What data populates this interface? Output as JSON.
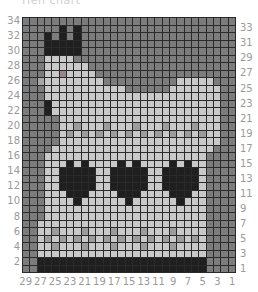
{
  "title": "Hen chart",
  "chart": {
    "columns": 29,
    "rows": 34,
    "legend": {
      ".": {
        "name": "background",
        "color": "#7c7c7c"
      },
      "L": {
        "name": "light",
        "color": "#c9c9c9"
      },
      "M": {
        "name": "medium",
        "color": "#9c9c9c"
      },
      "D": {
        "name": "dark",
        "color": "#1f1f1f"
      },
      "E": {
        "name": "eye",
        "color": "#9a8686"
      },
      "B": {
        "name": "beak",
        "color": "#a8a8a8"
      }
    },
    "grid_rows_top_to_bottom": [
      ".............................",
      ".....D.D.....................",
      "...D.D.D.....................",
      "...DDDDD.....................",
      "...DDDDD.....................",
      "...LLLL......................",
      "...LLLLLL....................",
      "...LLELLLL...................",
      "..BLLLLLLLL..........LLLLL...",
      "...LLLLLLLLLLL......LLLLLLL..",
      "...LLLLLLLLLLLLLLLLLLLLLLLL..",
      "...DLLLLLLLLLLLLLLLLLLLLLLL..",
      "...DLLLLLLLLLLLLLLLLLLLLLLL..",
      ".....LLLLLLLLLLLLLLLLLLLLLL..",
      ".....LLMLLLMLLLMLLLMLLLMLLL..",
      ".....LMLMLMLMLMLMLMLMLMLMLL..",
      ".....LLLLLLLLLLLLLLLLLLLLLL..",
      "....LLLLLLLLLLLLLLLLLLLLLL...",
      "...LLLLLLLLLLLLLLLLLLLLLL....",
      "...LLLDLDLLLLDLDLLLLDLDLL....",
      "...LLDDDDDLLDDDDDLLDDDDDL....",
      "...LLDDDDDLLDDDDDLLDDDDDL....",
      "...LLDDDDDLLDDDDDLLDDDDDL....",
      "...LLLDDDLLLLDDDLLLLDDDLL....",
      "...LLLLDLLLLLLDLLLLLLDLLL....",
      "...LLLLLLLLLLLLLLLLLLLLLL....",
      "...LLLLLLLLLLLLLLLLLLLLLL....",
      "..LLLLLLLLLLLLLLLLLLLLLLL....",
      "..LLMLLLMLLLMLLLMLLLMLLLL....",
      "..LMLMLMLMLMLMLMLMLMLMLML....",
      "..LLMLLLMLLLMLLLMLLLMLLLL....",
      "..LLLLLLLLLLLLLLLLLLLLLLL....",
      "..DDDDDDDDDDDDDDDDDDDDDDD....",
      "..DDDDDDDDDDDDDDDDDDDDDDD...."
    ]
  },
  "axes": {
    "left_labels": [
      "34",
      "32",
      "30",
      "28",
      "26",
      "24",
      "22",
      "20",
      "18",
      "16",
      "14",
      "12",
      "10",
      "8",
      "6",
      "4",
      "2"
    ],
    "right_labels": [
      "33",
      "31",
      "29",
      "27",
      "25",
      "23",
      "21",
      "19",
      "17",
      "15",
      "13",
      "11",
      "9",
      "7",
      "5",
      "3",
      "1"
    ],
    "bottom_labels": [
      "29",
      "27",
      "25",
      "23",
      "21",
      "19",
      "17",
      "15",
      "13",
      "11",
      "9",
      "7",
      "5",
      "3",
      "1"
    ]
  }
}
